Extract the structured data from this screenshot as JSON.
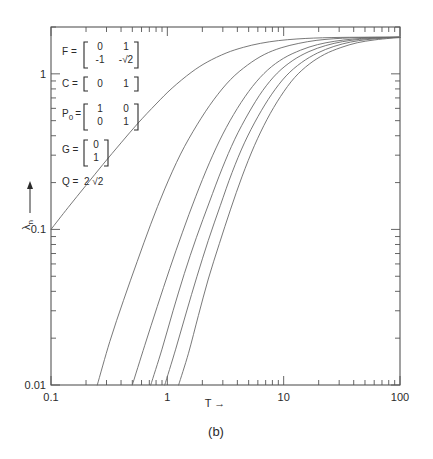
{
  "figure": {
    "caption": "(b)",
    "annotations": [
      {
        "name": "F",
        "eq": "F =",
        "type": "matrix2x2",
        "rows": [
          [
            "0",
            "1"
          ],
          [
            "-1",
            "-√2"
          ]
        ]
      },
      {
        "name": "C",
        "eq": "C =",
        "type": "matrix1x2",
        "rows": [
          [
            "0",
            "1"
          ]
        ]
      },
      {
        "name": "P0",
        "eq": "P",
        "sub": "0",
        "eqtail": "=",
        "type": "matrix2x2",
        "rows": [
          [
            "1",
            "0"
          ],
          [
            "0",
            "1"
          ]
        ]
      },
      {
        "name": "G",
        "eq": "G =",
        "type": "matrix2x1",
        "rows": [
          [
            "0"
          ],
          [
            "1"
          ]
        ]
      },
      {
        "name": "Q",
        "eq": "Q =",
        "type": "scalar",
        "value": "2 √2"
      }
    ]
  },
  "chart_data": {
    "type": "line",
    "title": "",
    "xlabel": "T",
    "xlabel_arrow": "→",
    "ylabel": "λ",
    "ylabel_sub": "n",
    "ylabel_arrow": "→",
    "xscale": "log",
    "yscale": "log",
    "xlim": [
      0.1,
      100
    ],
    "ylim": [
      0.01,
      2.0
    ],
    "xticks": [
      0.1,
      1,
      10,
      100
    ],
    "xticklabels": [
      "0.1",
      "1",
      "10",
      "100"
    ],
    "yticks": [
      0.01,
      0.1,
      1
    ],
    "yticklabels": [
      "0.01",
      "0.1",
      "1"
    ],
    "grid": false,
    "legend": "none",
    "minor_ticks": true,
    "asymptote": 1.72,
    "series": [
      {
        "name": "curve-1",
        "x": [
          0.1,
          0.14,
          0.2,
          0.28,
          0.4,
          0.56,
          0.8,
          1.1,
          1.6,
          2.2,
          3.2,
          4.5,
          6.3,
          9.0,
          13.0,
          18.0,
          26.0,
          37.0,
          52.0,
          72.0,
          100.0
        ],
        "y": [
          0.1,
          0.138,
          0.192,
          0.262,
          0.36,
          0.482,
          0.64,
          0.81,
          1.02,
          1.19,
          1.36,
          1.48,
          1.57,
          1.635,
          1.675,
          1.697,
          1.711,
          1.717,
          1.72,
          1.72,
          1.72
        ]
      },
      {
        "name": "curve-2",
        "x": [
          0.25,
          0.32,
          0.42,
          0.55,
          0.72,
          0.95,
          1.3,
          1.8,
          2.5,
          3.5,
          4.9,
          6.8,
          9.5,
          13.5,
          19.0,
          27.0,
          38.0,
          54.0,
          75.0,
          100.0
        ],
        "y": [
          0.01,
          0.019,
          0.035,
          0.062,
          0.108,
          0.182,
          0.305,
          0.47,
          0.68,
          0.92,
          1.14,
          1.33,
          1.47,
          1.57,
          1.64,
          1.681,
          1.703,
          1.714,
          1.719,
          1.72
        ]
      },
      {
        "name": "curve-3",
        "x": [
          0.5,
          0.64,
          0.82,
          1.05,
          1.35,
          1.75,
          2.3,
          3.0,
          4.0,
          5.4,
          7.3,
          10.0,
          14.0,
          19.5,
          27.5,
          39.0,
          55.0,
          76.0,
          100.0
        ],
        "y": [
          0.01,
          0.018,
          0.032,
          0.056,
          0.096,
          0.162,
          0.268,
          0.41,
          0.6,
          0.83,
          1.06,
          1.26,
          1.42,
          1.54,
          1.62,
          1.672,
          1.699,
          1.713,
          1.72
        ]
      },
      {
        "name": "curve-4",
        "x": [
          0.72,
          0.9,
          1.12,
          1.4,
          1.78,
          2.3,
          2.95,
          3.8,
          5.0,
          6.6,
          8.8,
          12.0,
          16.5,
          23.0,
          32.0,
          45.0,
          62.0,
          85.0,
          100.0
        ],
        "y": [
          0.01,
          0.017,
          0.03,
          0.052,
          0.089,
          0.15,
          0.245,
          0.38,
          0.56,
          0.78,
          1.01,
          1.22,
          1.39,
          1.52,
          1.61,
          1.666,
          1.697,
          1.714,
          1.72
        ]
      },
      {
        "name": "curve-5",
        "x": [
          0.95,
          1.18,
          1.45,
          1.8,
          2.25,
          2.85,
          3.6,
          4.6,
          6.0,
          7.9,
          10.5,
          14.2,
          19.5,
          27.0,
          37.5,
          52.0,
          72.0,
          100.0
        ],
        "y": [
          0.01,
          0.017,
          0.029,
          0.05,
          0.085,
          0.142,
          0.232,
          0.36,
          0.53,
          0.74,
          0.97,
          1.18,
          1.36,
          1.5,
          1.6,
          1.66,
          1.695,
          1.72
        ]
      },
      {
        "name": "curve-6",
        "x": [
          1.25,
          1.52,
          1.85,
          2.25,
          2.8,
          3.5,
          4.4,
          5.6,
          7.2,
          9.4,
          12.4,
          16.6,
          22.5,
          31.0,
          43.0,
          60.0,
          82.0,
          100.0
        ],
        "y": [
          0.01,
          0.016,
          0.028,
          0.048,
          0.081,
          0.135,
          0.22,
          0.345,
          0.51,
          0.715,
          0.945,
          1.155,
          1.335,
          1.475,
          1.585,
          1.651,
          1.692,
          1.71
        ]
      }
    ]
  }
}
